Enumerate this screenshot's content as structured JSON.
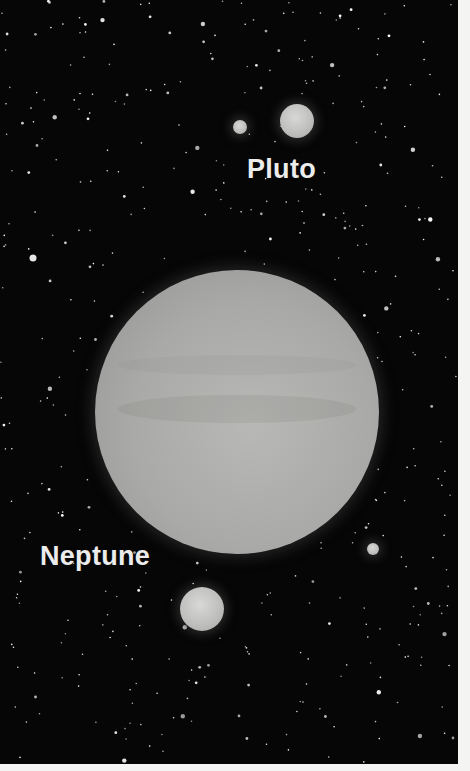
{
  "image": {
    "description": "Illustration of Neptune and Pluto with moons against a starfield",
    "background_color": "#060606"
  },
  "labels": {
    "pluto": "Pluto",
    "neptune": "Neptune"
  },
  "bodies": [
    {
      "name": "neptune",
      "cx": 237,
      "cy": 412,
      "r": 142
    },
    {
      "name": "neptune-moon-triton",
      "cx": 202,
      "cy": 609,
      "r": 22
    },
    {
      "name": "neptune-moon-small",
      "cx": 373,
      "cy": 549,
      "r": 6
    },
    {
      "name": "pluto",
      "cx": 297,
      "cy": 121,
      "r": 17
    },
    {
      "name": "pluto-moon-charon",
      "cx": 240,
      "cy": 127,
      "r": 7
    }
  ]
}
